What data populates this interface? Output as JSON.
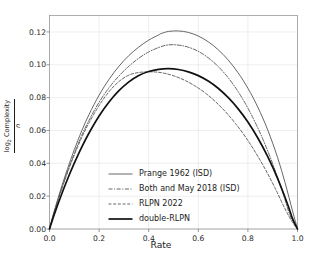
{
  "chart_data": {
    "type": "line",
    "title": "",
    "xlabel": "Rate",
    "ylabel_numerator": "log",
    "ylabel_numerator_sub": "2",
    "ylabel_numerator_rest": " Complexity",
    "ylabel_denominator": "n",
    "xlim": [
      0.0,
      1.0
    ],
    "ylim": [
      0.0,
      0.13
    ],
    "xticks": [
      "0.0",
      "0.2",
      "0.4",
      "0.6",
      "0.8",
      "1.0"
    ],
    "xtick_values": [
      0.0,
      0.2,
      0.4,
      0.6,
      0.8,
      1.0
    ],
    "yticks": [
      "0.00",
      "0.02",
      "0.04",
      "0.06",
      "0.08",
      "0.10",
      "0.12"
    ],
    "ytick_values": [
      0.0,
      0.02,
      0.04,
      0.06,
      0.08,
      0.1,
      0.12
    ],
    "grid": true,
    "legend_position": "lower-center-left",
    "series": [
      {
        "name": "Prange 1962 (ISD)",
        "style": "solid",
        "color": "#555555",
        "width": 0.9,
        "peak_x": 0.45,
        "peak_y": 0.1206,
        "x": [
          0.0,
          0.02,
          0.05,
          0.08,
          0.1,
          0.13,
          0.16,
          0.2,
          0.24,
          0.28,
          0.32,
          0.36,
          0.4,
          0.44,
          0.45,
          0.48,
          0.52,
          0.56,
          0.6,
          0.64,
          0.68,
          0.72,
          0.76,
          0.8,
          0.84,
          0.88,
          0.92,
          0.95,
          0.98,
          1.0
        ],
        "y": [
          0.0,
          0.0113,
          0.0263,
          0.0399,
          0.0483,
          0.0598,
          0.0699,
          0.0815,
          0.0911,
          0.0991,
          0.1056,
          0.1108,
          0.115,
          0.1182,
          0.119,
          0.1203,
          0.1206,
          0.1197,
          0.1175,
          0.114,
          0.1092,
          0.103,
          0.0952,
          0.0857,
          0.0742,
          0.0603,
          0.0434,
          0.0281,
          0.011,
          0.0
        ]
      },
      {
        "name": "Both and May 2018 (ISD)",
        "style": "dashdot",
        "color": "#555555",
        "width": 0.9,
        "peak_x": 0.47,
        "peak_y": 0.1122,
        "x": [
          0.0,
          0.02,
          0.05,
          0.08,
          0.1,
          0.13,
          0.16,
          0.2,
          0.24,
          0.28,
          0.32,
          0.36,
          0.4,
          0.44,
          0.47,
          0.5,
          0.54,
          0.58,
          0.62,
          0.66,
          0.7,
          0.74,
          0.78,
          0.82,
          0.86,
          0.9,
          0.94,
          0.97,
          1.0
        ],
        "y": [
          0.0,
          0.0108,
          0.0251,
          0.0381,
          0.0461,
          0.057,
          0.0664,
          0.0772,
          0.086,
          0.0932,
          0.0991,
          0.104,
          0.1078,
          0.1105,
          0.1119,
          0.1122,
          0.1115,
          0.1096,
          0.1064,
          0.1018,
          0.0958,
          0.0882,
          0.0789,
          0.0678,
          0.0548,
          0.0397,
          0.0225,
          0.0083,
          0.0
        ]
      },
      {
        "name": "RLPN 2022",
        "style": "dashed",
        "color": "#555555",
        "width": 0.9,
        "peak_x": 0.435,
        "peak_y": 0.0957,
        "x": [
          0.0,
          0.02,
          0.05,
          0.08,
          0.1,
          0.13,
          0.16,
          0.2,
          0.24,
          0.28,
          0.32,
          0.36,
          0.4,
          0.435,
          0.47,
          0.51,
          0.55,
          0.59,
          0.63,
          0.67,
          0.71,
          0.75,
          0.79,
          0.83,
          0.87,
          0.91,
          0.95,
          0.98,
          1.0
        ],
        "y": [
          0.0,
          0.0106,
          0.0246,
          0.0373,
          0.0451,
          0.0557,
          0.0648,
          0.0752,
          0.0836,
          0.0898,
          0.0937,
          0.0953,
          0.0957,
          0.0955,
          0.0946,
          0.0928,
          0.0902,
          0.0868,
          0.0826,
          0.0774,
          0.0713,
          0.0642,
          0.0561,
          0.0468,
          0.0364,
          0.0248,
          0.0122,
          0.004,
          0.0
        ]
      },
      {
        "name": "double-RLPN",
        "style": "solid",
        "color": "#111111",
        "width": 1.7,
        "peak_x": 0.48,
        "peak_y": 0.0976,
        "x": [
          0.0,
          0.02,
          0.05,
          0.08,
          0.1,
          0.13,
          0.16,
          0.2,
          0.24,
          0.28,
          0.32,
          0.36,
          0.4,
          0.44,
          0.48,
          0.52,
          0.56,
          0.6,
          0.64,
          0.68,
          0.72,
          0.76,
          0.8,
          0.84,
          0.88,
          0.92,
          0.96,
          0.98,
          1.0
        ],
        "y": [
          0.0,
          0.0092,
          0.0216,
          0.033,
          0.0401,
          0.0499,
          0.0586,
          0.0688,
          0.0773,
          0.0842,
          0.0896,
          0.0935,
          0.0959,
          0.0972,
          0.0976,
          0.0971,
          0.0957,
          0.0934,
          0.0901,
          0.0857,
          0.0801,
          0.0733,
          0.0651,
          0.0554,
          0.044,
          0.0307,
          0.0151,
          0.0063,
          0.0
        ]
      }
    ]
  },
  "legend": {
    "items": [
      {
        "label": "Prange 1962 (ISD)"
      },
      {
        "label": "Both and May 2018 (ISD)"
      },
      {
        "label": "RLPN 2022"
      },
      {
        "label": "double-RLPN"
      }
    ]
  }
}
